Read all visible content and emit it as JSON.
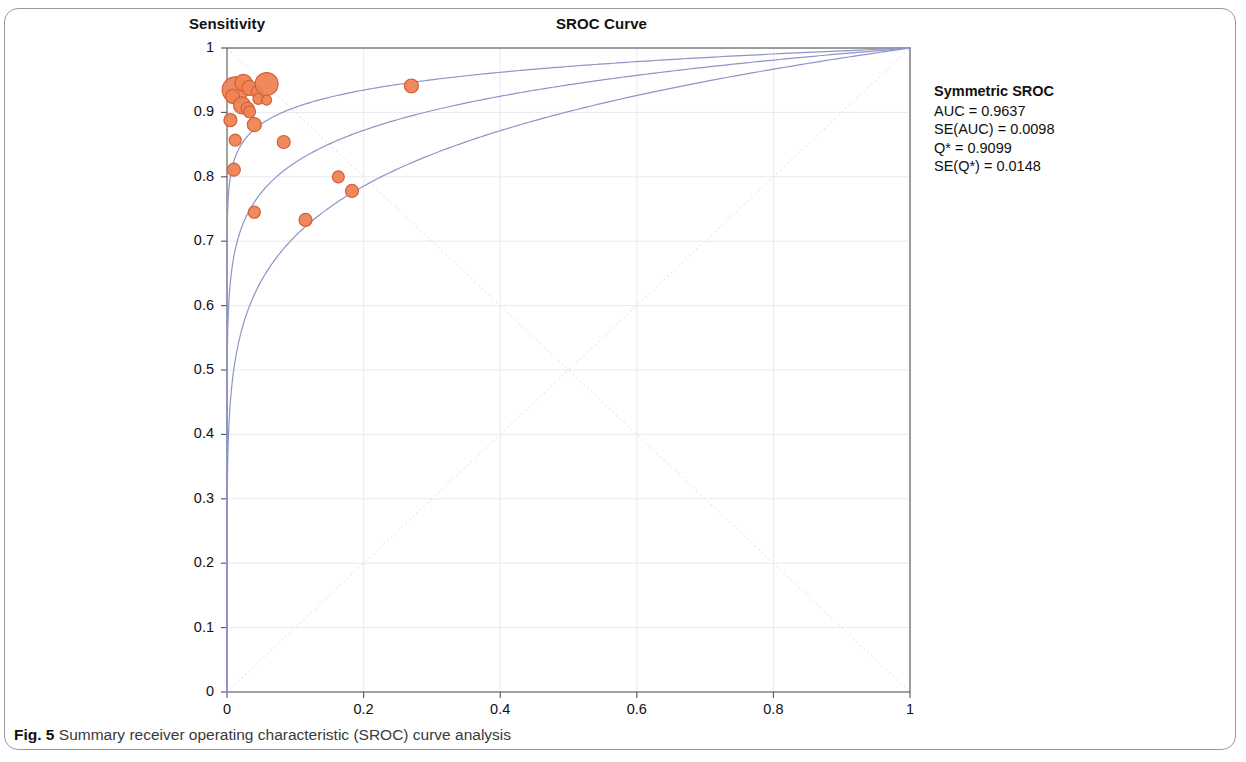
{
  "figure": {
    "caption_label": "Fig. 5",
    "caption_text": "Summary receiver operating characteristic (SROC) curve analysis"
  },
  "annotation": {
    "title": "Symmetric SROC",
    "auc": "AUC = 0.9637",
    "se_auc": "SE(AUC) = 0.0098",
    "q_star": "Q* = 0.9099",
    "se_q_star": "SE(Q*) = 0.0148"
  },
  "colors": {
    "marker_fill": "#ef8354",
    "marker_stroke": "#d2603a",
    "curve": "#8f93c8",
    "grid": "#e9e9ef",
    "diagonal": "#dcdce4",
    "axis": "#555555"
  },
  "chart_data": {
    "type": "scatter",
    "title": "SROC Curve",
    "xlabel": "1-specificity",
    "ylabel": "Sensitivity",
    "ylabel_position": "top-left",
    "xlim": [
      0,
      1
    ],
    "ylim": [
      0,
      1
    ],
    "xticks": [
      "0",
      "0.2",
      "0.4",
      "0.6",
      "0.8",
      "1"
    ],
    "xtick_values": [
      0,
      0.2,
      0.4,
      0.6,
      0.8,
      1
    ],
    "yticks": [
      "0",
      "0.1",
      "0.2",
      "0.3",
      "0.4",
      "0.5",
      "0.6",
      "0.7",
      "0.8",
      "0.9",
      "1"
    ],
    "ytick_values": [
      0,
      0.1,
      0.2,
      0.3,
      0.4,
      0.5,
      0.6,
      0.7,
      0.8,
      0.9,
      1
    ],
    "grid": true,
    "legend": false,
    "points": [
      {
        "x": 0.012,
        "y": 0.935,
        "size": 13.0
      },
      {
        "x": 0.024,
        "y": 0.946,
        "size": 8.5
      },
      {
        "x": 0.008,
        "y": 0.925,
        "size": 7.0
      },
      {
        "x": 0.033,
        "y": 0.938,
        "size": 7.5
      },
      {
        "x": 0.044,
        "y": 0.932,
        "size": 6.0
      },
      {
        "x": 0.058,
        "y": 0.944,
        "size": 11.5
      },
      {
        "x": 0.046,
        "y": 0.921,
        "size": 5.5
      },
      {
        "x": 0.058,
        "y": 0.919,
        "size": 5.0
      },
      {
        "x": 0.022,
        "y": 0.911,
        "size": 8.5
      },
      {
        "x": 0.03,
        "y": 0.906,
        "size": 6.5
      },
      {
        "x": 0.033,
        "y": 0.901,
        "size": 6.0
      },
      {
        "x": 0.005,
        "y": 0.888,
        "size": 6.5
      },
      {
        "x": 0.04,
        "y": 0.881,
        "size": 7.0
      },
      {
        "x": 0.012,
        "y": 0.857,
        "size": 6.0
      },
      {
        "x": 0.083,
        "y": 0.854,
        "size": 6.5
      },
      {
        "x": 0.01,
        "y": 0.811,
        "size": 6.5
      },
      {
        "x": 0.163,
        "y": 0.8,
        "size": 6.0
      },
      {
        "x": 0.183,
        "y": 0.778,
        "size": 6.5
      },
      {
        "x": 0.04,
        "y": 0.745,
        "size": 6.0
      },
      {
        "x": 0.115,
        "y": 0.733,
        "size": 6.5
      },
      {
        "x": 0.27,
        "y": 0.941,
        "size": 7.0
      }
    ],
    "curves": [
      {
        "name": "sroc-curve-lower",
        "shape_exponent": 0.15
      },
      {
        "name": "sroc-curve-main",
        "shape_exponent": 0.085
      },
      {
        "name": "sroc-curve-upper",
        "shape_exponent": 0.042
      }
    ]
  }
}
